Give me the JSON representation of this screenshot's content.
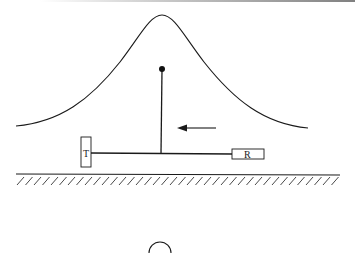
{
  "diagram": {
    "type": "physics-schematic",
    "labels": {
      "transmitter": "T",
      "receiver": "R"
    },
    "colors": {
      "stroke": "#1a1a1a",
      "background": "#ffffff",
      "top_rule": "#9a9a9a"
    },
    "elements": [
      "top-rule",
      "hill-curve",
      "pole-with-ball",
      "leftward-arrow",
      "transmitter-box",
      "connecting-line",
      "receiver-box",
      "ground-line",
      "ground-hatching",
      "partial-circle"
    ]
  }
}
